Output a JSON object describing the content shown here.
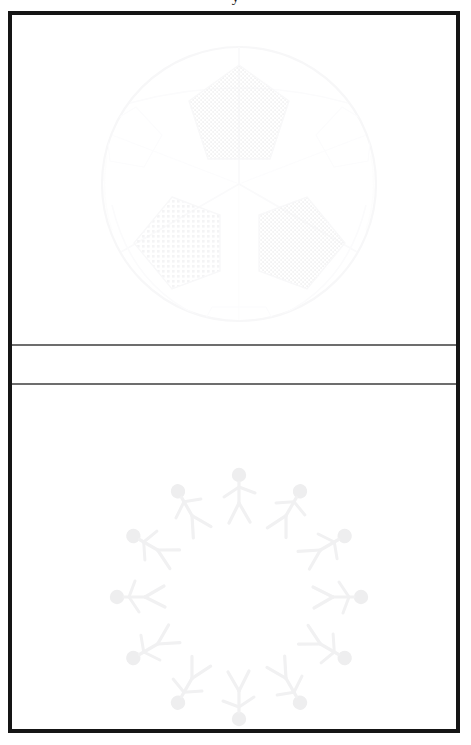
{
  "caption": {
    "top_text_fragment": "y",
    "note": "caption text cropped off above the top edge of the image"
  },
  "frame": {
    "border_color": "#151515",
    "background_color": "#ffffff",
    "divider_color": "#6d6d6d"
  },
  "panels": [
    {
      "id": "top-panel",
      "name": "soccer-ball-panel",
      "figure_label": "soccer-ball",
      "ink_color": "#fbfbfc"
    },
    {
      "id": "middle-panel",
      "name": "blank-band",
      "figure_label": "",
      "ink_color": "#ffffff"
    },
    {
      "id": "bottom-panel",
      "name": "stick-figure-ring-panel",
      "figure_label": "stick-figure-ring",
      "ink_color": "#f4f4f5"
    }
  ],
  "soccer_ball": {
    "center_x": 227,
    "center_y": 169,
    "radius": 137,
    "outline_color": "#fafafb",
    "patch_color": "#f7f7f8",
    "seam_color": "#fbfbfc",
    "patch_count": 3,
    "patches": [
      {
        "name": "top-center-patch",
        "cx": 227,
        "cy": 95,
        "r": 48
      },
      {
        "name": "lower-left-patch",
        "cx": 160,
        "cy": 228,
        "r": 46
      },
      {
        "name": "lower-right-patch",
        "cx": 295,
        "cy": 228,
        "r": 46
      }
    ]
  },
  "figure_ring": {
    "center_x": 227,
    "center_y": 545,
    "radius": 112,
    "count": 12,
    "ink_color": "#f3f3f4",
    "head_color": "#eeeeef",
    "angles_deg": [
      0,
      30,
      60,
      90,
      120,
      150,
      180,
      210,
      240,
      270,
      300,
      330
    ]
  }
}
